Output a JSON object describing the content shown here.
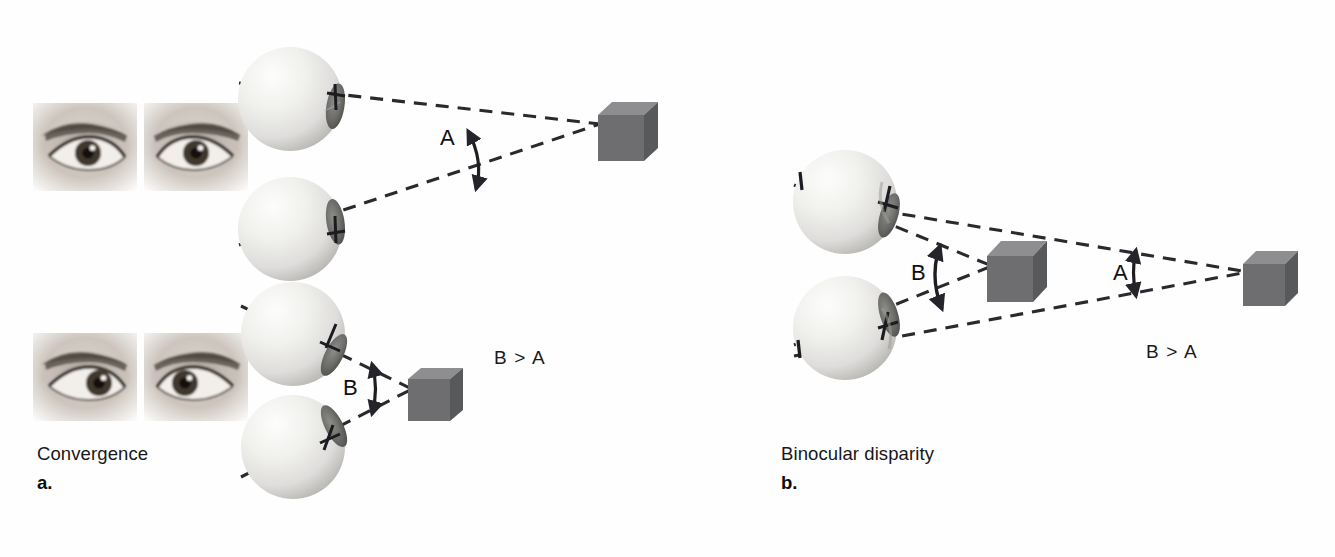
{
  "figure": {
    "width": 1335,
    "height": 557,
    "background": "#fefefe"
  },
  "colors": {
    "line": "#2a2a2e",
    "cube_front": "#6e6e70",
    "cube_top": "#8c8c8e",
    "cube_side": "#595a5c",
    "eyeball_light": "#f4f4f2",
    "eyeball_mid": "#dcdcd8",
    "eyeball_shadow": "#b9b9b4",
    "iris": "#5a5a58",
    "text": "#18171a",
    "skin_light": "#e8e4e0",
    "skin_mid": "#b9b2ab",
    "brow_dark": "#4a443e",
    "iris_photo": "#3a332c"
  },
  "panels": [
    {
      "id": "a",
      "title": "Convergence",
      "letter": "a.",
      "title_pos": {
        "x": 37,
        "y": 443
      },
      "letter_pos": {
        "x": 37,
        "y": 472
      },
      "relation_label": "B > A",
      "relation_pos": {
        "x": 494,
        "y": 347
      },
      "angle_labels": [
        {
          "text": "A",
          "x": 440,
          "y": 125
        },
        {
          "text": "B",
          "x": 343,
          "y": 375
        }
      ],
      "eye_photos": [
        {
          "name": "eyes-far-focus",
          "x": 33,
          "y": 103,
          "w": 215,
          "h": 88,
          "gaze": "parallel"
        },
        {
          "name": "eyes-near-focus",
          "x": 33,
          "y": 333,
          "w": 215,
          "h": 88,
          "gaze": "converged"
        }
      ],
      "eyeballs": [
        {
          "name": "eyeball-upper-far",
          "cx": 290,
          "cy": 99,
          "r": 52,
          "gaze_deg": 9
        },
        {
          "name": "eyeball-lower-far",
          "cx": 290,
          "cy": 229,
          "r": 52,
          "gaze_deg": -9
        },
        {
          "name": "eyeball-upper-near",
          "cx": 293,
          "cy": 334,
          "r": 52,
          "gaze_deg": 27
        },
        {
          "name": "eyeball-lower-near",
          "cx": 293,
          "cy": 447,
          "r": 52,
          "gaze_deg": -27
        }
      ],
      "cubes": [
        {
          "name": "cube-far-target",
          "x": 598,
          "y": 102,
          "size": 46
        },
        {
          "name": "cube-near-target",
          "x": 408,
          "y": 368,
          "size": 42
        }
      ]
    },
    {
      "id": "b",
      "title": "Binocular disparity",
      "letter": "b.",
      "title_pos": {
        "x": 781,
        "y": 443
      },
      "letter_pos": {
        "x": 781,
        "y": 472
      },
      "relation_label": "B > A",
      "relation_pos": {
        "x": 1146,
        "y": 341
      },
      "angle_labels": [
        {
          "text": "B",
          "x": 911,
          "y": 260
        },
        {
          "text": "A",
          "x": 1113,
          "y": 260
        }
      ],
      "eyeballs": [
        {
          "name": "eyeball-upper",
          "cx": 845,
          "cy": 202,
          "r": 52,
          "gaze_deg": 16
        },
        {
          "name": "eyeball-lower",
          "cx": 845,
          "cy": 328,
          "r": 52,
          "gaze_deg": -16
        }
      ],
      "cubes": [
        {
          "name": "cube-near-target",
          "x": 987,
          "y": 241,
          "size": 46
        },
        {
          "name": "cube-far-target",
          "x": 1243,
          "y": 251,
          "size": 42
        }
      ]
    }
  ]
}
